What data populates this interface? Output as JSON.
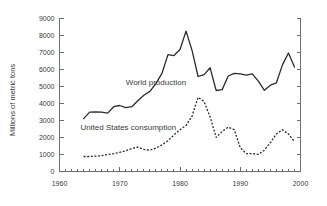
{
  "chart_data": {
    "type": "line",
    "title": "",
    "xlabel": "",
    "ylabel": "Millions of metric tons",
    "xlim": [
      1960,
      2000
    ],
    "ylim": [
      0,
      9000
    ],
    "ytick_step": 1000,
    "xtick_step": 10,
    "xminor_step": 1,
    "grid": false,
    "legend": "inline-annotations",
    "ytick_labels": [
      "0",
      "1000",
      "2000",
      "3000",
      "4000",
      "5000",
      "6000",
      "7000",
      "8000",
      "9000"
    ],
    "xtick_labels": [
      "1960",
      "1970",
      "1980",
      "1990",
      "2000"
    ],
    "series": [
      {
        "name": "World production",
        "style": "solid",
        "label_x": 1971.0,
        "label_y": 5050,
        "x": [
          1964,
          1965,
          1966,
          1967,
          1968,
          1969,
          1970,
          1971,
          1972,
          1973,
          1974,
          1975,
          1976,
          1977,
          1978,
          1979,
          1980,
          1981,
          1982,
          1983,
          1984,
          1985,
          1986,
          1987,
          1988,
          1989,
          1990,
          1991,
          1992,
          1993,
          1994,
          1995,
          1996,
          1997,
          1998,
          1999
        ],
        "values": [
          3100,
          3480,
          3500,
          3480,
          3420,
          3800,
          3870,
          3750,
          3800,
          4150,
          4470,
          4700,
          5150,
          5750,
          6850,
          6800,
          7150,
          8230,
          7100,
          5570,
          5680,
          6080,
          4750,
          4800,
          5600,
          5750,
          5720,
          5650,
          5720,
          5300,
          4760,
          5060,
          5200,
          6250,
          6950,
          6120
        ]
      },
      {
        "name": "United States consumption",
        "style": "dashed",
        "label_x": 1963.5,
        "label_y": 2420,
        "x": [
          1964,
          1965,
          1966,
          1967,
          1968,
          1969,
          1970,
          1971,
          1972,
          1973,
          1974,
          1975,
          1976,
          1977,
          1978,
          1979,
          1980,
          1981,
          1982,
          1983,
          1984,
          1985,
          1986,
          1987,
          1988,
          1989,
          1990,
          1991,
          1992,
          1993,
          1994,
          1995,
          1996,
          1997,
          1998,
          1999
        ],
        "values": [
          880,
          880,
          900,
          930,
          1000,
          1050,
          1120,
          1220,
          1350,
          1430,
          1300,
          1250,
          1370,
          1560,
          1800,
          2150,
          2450,
          2700,
          3250,
          4350,
          4100,
          3200,
          2000,
          2350,
          2600,
          2450,
          1400,
          1050,
          1050,
          1200,
          1600,
          1500,
          1480,
          1100,
          750,
          1000
        ]
      }
    ],
    "series2_tail": {
      "x": [
        1993,
        1994,
        1995,
        1996,
        1997,
        1998,
        1999
      ],
      "values": [
        1000,
        1250,
        1700,
        2200,
        2450,
        2200,
        1750
      ]
    }
  },
  "colors": {
    "axis": "#6f6f6f",
    "line": "#2b2b2b",
    "text": "#3a3a3a",
    "background": "#ffffff"
  }
}
